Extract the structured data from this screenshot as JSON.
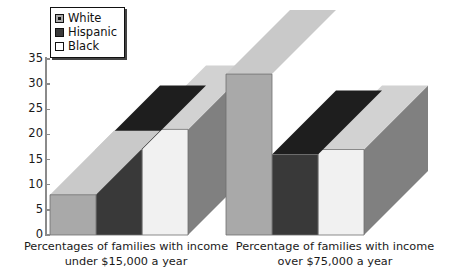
{
  "chart_data": {
    "type": "bar",
    "title": "",
    "xlabel": "",
    "ylabel": "",
    "ylim": [
      0,
      35
    ],
    "yticks": [
      0,
      5,
      10,
      15,
      20,
      25,
      30,
      35
    ],
    "grid": false,
    "legend_position": "top-left",
    "style": "3d-grouped-bar",
    "categories": [
      "Percentages of families with income under $15,000 a year",
      "Percentage of families with income over $75,000 a year"
    ],
    "series": [
      {
        "name": "White",
        "values": [
          8,
          32
        ],
        "color": "#a9a9a9",
        "top_color": "#c9c9c9"
      },
      {
        "name": "Hispanic",
        "values": [
          17,
          16
        ],
        "color": "#393939",
        "top_color": "#1e1e1e"
      },
      {
        "name": "Black",
        "values": [
          21,
          17
        ],
        "color": "#f1f1f1",
        "top_color": "#d2d2d2"
      }
    ],
    "side_face_color": "#808080",
    "axis_color": "#8a8a8a"
  },
  "legend": {
    "items": [
      {
        "label": "White",
        "swatch": "gray-swatch"
      },
      {
        "label": "Hispanic",
        "swatch": "dark-swatch"
      },
      {
        "label": "Black",
        "swatch": "white-swatch"
      }
    ]
  },
  "yaxis": {
    "labels": [
      "35",
      "30",
      "25",
      "20",
      "15",
      "10",
      "5",
      "0"
    ]
  },
  "xaxis": {
    "labels": [
      "Percentages of families with income\nunder $15,000 a year",
      "Percentage of families with income\nover $75,000 a year"
    ]
  }
}
